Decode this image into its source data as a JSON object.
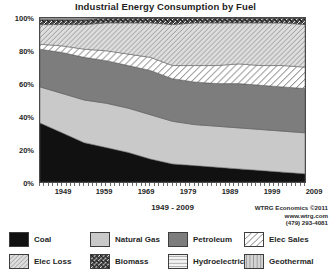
{
  "chart_data": {
    "type": "area",
    "title": "Industrial Energy Consumption by Fuel",
    "xlabel": "1949 - 2009",
    "ylabel": "",
    "stacked": true,
    "normalized": true,
    "grid": false,
    "legend_position": "bottom",
    "xlim": [
      1949,
      2009
    ],
    "ylim": [
      0,
      100
    ],
    "yticks": [
      "0%",
      "20%",
      "40%",
      "60%",
      "80%",
      "100%"
    ],
    "xticks": [
      "1949",
      "1959",
      "1969",
      "1979",
      "1989",
      "1999",
      "2009"
    ],
    "x": [
      1949,
      1954,
      1959,
      1964,
      1969,
      1974,
      1979,
      1984,
      1989,
      1994,
      1999,
      2004,
      2009
    ],
    "series": [
      {
        "name": "Coal",
        "pattern": "solid-black",
        "color": "#111111",
        "values": [
          36,
          30,
          24,
          21,
          18,
          14,
          11,
          10,
          9,
          8,
          7,
          6,
          5
        ]
      },
      {
        "name": "Natural Gas",
        "pattern": "solid-light-gray",
        "color": "#c9c9c9",
        "values": [
          22,
          24,
          26,
          27,
          27,
          27,
          26,
          25,
          25,
          25,
          25,
          25,
          25
        ]
      },
      {
        "name": "Petroleum",
        "pattern": "solid-mid-gray",
        "color": "#7d7d7d",
        "values": [
          23,
          25,
          26,
          26,
          26,
          27,
          26,
          26,
          26,
          27,
          27,
          27,
          27
        ]
      },
      {
        "name": "Elec Sales",
        "pattern": "sparse-diagonal",
        "color": "#ffffff",
        "values": [
          3,
          4,
          5,
          6,
          7,
          8,
          8,
          10,
          11,
          12,
          12,
          13,
          13
        ]
      },
      {
        "name": "Elec Loss",
        "pattern": "light-diagonal",
        "color": "#d8d8d8",
        "values": [
          12,
          13,
          15,
          17,
          19,
          21,
          25,
          26,
          26,
          25,
          26,
          26,
          26
        ]
      },
      {
        "name": "Biomass",
        "pattern": "dense-crosshatch",
        "color": "#3a3a3a",
        "values": [
          3,
          3,
          3,
          3,
          3,
          3,
          4,
          3,
          3,
          3,
          3,
          3,
          4
        ]
      },
      {
        "name": "Hydroelectric",
        "pattern": "horizontal-lines",
        "color": "#f0f0f0",
        "values": [
          1,
          1,
          1,
          0,
          0,
          0,
          0,
          0,
          0,
          0,
          0,
          0,
          0
        ]
      },
      {
        "name": "Geothermal",
        "pattern": "vertical-lines",
        "color": "#d0d0d0",
        "values": [
          0,
          0,
          0,
          0,
          0,
          0,
          0,
          0,
          0,
          0,
          0,
          0,
          0
        ]
      }
    ]
  },
  "chart": {
    "title": "Industrial Energy Consumption by Fuel",
    "axis_title": "1949 - 2009",
    "yticks": [
      {
        "label": "100%",
        "top": 14
      },
      {
        "label": "80%",
        "top": 47
      },
      {
        "label": "60%",
        "top": 80
      },
      {
        "label": "40%",
        "top": 113
      },
      {
        "label": "20%",
        "top": 146
      },
      {
        "label": "0%",
        "top": 179
      }
    ],
    "xticks": [
      {
        "label": "1949",
        "left": 24
      },
      {
        "label": "1959",
        "left": 65
      },
      {
        "label": "1969",
        "left": 107
      },
      {
        "label": "1979",
        "left": 149
      },
      {
        "label": "1989",
        "left": 191
      },
      {
        "label": "1999",
        "left": 233
      },
      {
        "label": "2009",
        "left": 275
      }
    ]
  },
  "credit": {
    "line1": "WTRG Economics ©2011",
    "line2": "www.wtrg.com",
    "line3": "(479) 293-4081"
  },
  "legend": {
    "row1": [
      {
        "label": "Coal",
        "pattern": "solid-black",
        "left": 5
      },
      {
        "label": "Natural Gas",
        "pattern": "solid-light-gray",
        "left": 86
      },
      {
        "label": "Petroleum",
        "pattern": "solid-mid-gray",
        "left": 164
      },
      {
        "label": "Elec Sales",
        "pattern": "sparse-diagonal",
        "left": 240
      }
    ],
    "row2": [
      {
        "label": "Elec Loss",
        "pattern": "light-diagonal",
        "left": 5
      },
      {
        "label": "Biomass",
        "pattern": "dense-crosshatch",
        "left": 86
      },
      {
        "label": "Hydroelectric",
        "pattern": "horizontal-lines",
        "left": 164
      },
      {
        "label": "Geothermal",
        "pattern": "vertical-lines",
        "left": 240
      }
    ]
  }
}
